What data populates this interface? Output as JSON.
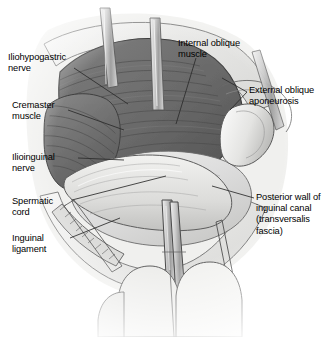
{
  "figure": {
    "background_color": "#ffffff",
    "width": 335,
    "height": 337
  },
  "colors": {
    "muscle_dark": "#6a6a6a",
    "muscle_mid": "#7d7d7d",
    "muscle_shadow": "#4e4e4e",
    "fascia_light": "#d8d8d6",
    "fascia_pale": "#e8e8e6",
    "skin_light": "#ebebe9",
    "instrument": "#b9b9b7",
    "outline": "#3a3a3a",
    "leader_line": "#2b2b2b",
    "label_text": "#000000"
  },
  "labels": [
    {
      "name": "iliohypogastric-nerve",
      "text": "Iliohypogastric\nnerve",
      "side": "left",
      "x": 8,
      "y": 52
    },
    {
      "name": "cremaster-muscle",
      "text": "Cremaster\nmuscle",
      "side": "left",
      "x": 12,
      "y": 100
    },
    {
      "name": "ilioinguinal-nerve",
      "text": "Ilioinguinal\nnerve",
      "side": "left",
      "x": 12,
      "y": 152
    },
    {
      "name": "spermatic-cord",
      "text": "Spermatic\ncord",
      "side": "left",
      "x": 12,
      "y": 196
    },
    {
      "name": "inguinal-ligament",
      "text": "Inguinal\nligament",
      "side": "left",
      "x": 12,
      "y": 233
    },
    {
      "name": "internal-oblique-muscle",
      "text": "Internal oblique\nmuscle",
      "side": "right",
      "x": 178,
      "y": 38
    },
    {
      "name": "external-oblique-aponeurosis",
      "text": "External oblique\naponeurosis",
      "side": "right",
      "x": 249,
      "y": 85
    },
    {
      "name": "posterior-wall-inguinal-canal",
      "text": "Posterior wall of\ninguinal canal\n(transversalis\nfascia)",
      "side": "right",
      "x": 256,
      "y": 192
    }
  ],
  "anatomy_regions": [
    {
      "name": "internal-oblique-muscle-region",
      "description": "Dark gray striated muscle belly occupying upper-left to center of the wound"
    },
    {
      "name": "cremaster-muscle-region",
      "description": "Striated muscle fibers on the left wall of the canal"
    },
    {
      "name": "spermatic-cord-region",
      "description": "Pale rounded cord structure crossing the lower center"
    },
    {
      "name": "posterior-wall-region",
      "description": "Smooth pale transversalis fascia forming the floor of the canal"
    },
    {
      "name": "external-oblique-flap-region",
      "description": "Folded pale aponeurotic flap retracted to the right"
    },
    {
      "name": "inguinal-ligament-region",
      "description": "Banded structure along the lower left wound edge"
    }
  ],
  "instruments": [
    {
      "name": "retractor-blade-upper-left",
      "description": "Narrow metal retractor at top-left of wound"
    },
    {
      "name": "retractor-blade-upper-center",
      "description": "Narrow metal retractor at top center of wound"
    },
    {
      "name": "forceps-center",
      "description": "Long forceps entering from bottom center"
    },
    {
      "name": "clamp-lower-left",
      "description": "Serrated clamp along lower left wound edge"
    },
    {
      "name": "retractor-right",
      "description": "Thin retractor at right side of wound"
    }
  ],
  "hands": [
    {
      "name": "gloved-finger-left",
      "description": "Gloved fingertip at bottom left"
    },
    {
      "name": "gloved-finger-center",
      "description": "Gloved fingertip at bottom center"
    },
    {
      "name": "gloved-finger-right",
      "description": "Gloved fingertip at bottom right"
    }
  ]
}
